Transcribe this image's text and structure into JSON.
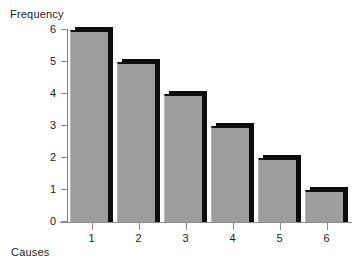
{
  "chart_data": {
    "type": "bar",
    "title": "",
    "xlabel": "Causes",
    "ylabel": "Frequency",
    "categories": [
      "1",
      "2",
      "3",
      "4",
      "5",
      "6"
    ],
    "values": [
      6,
      5,
      4,
      3,
      2,
      1
    ],
    "ylim": [
      0,
      6
    ],
    "yticks": [
      "0",
      "1",
      "2",
      "3",
      "4",
      "5",
      "6"
    ],
    "grid": false,
    "legend": null,
    "series": [
      {
        "name": "Frequency",
        "values": [
          6,
          5,
          4,
          3,
          2,
          1
        ]
      }
    ],
    "colors": {
      "bar_fill": "#9d9d9d",
      "bar_shadow": "#0d0d0d",
      "axis": "#8a8a8a",
      "text": "#1c1c1c",
      "background": "#ffffff"
    }
  }
}
